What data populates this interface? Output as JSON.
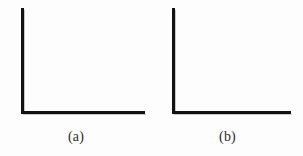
{
  "figure": {
    "background_color": "#fdfdfd",
    "stroke_color": "#121212",
    "shadow_color": "#c9c9c9",
    "caption_color": "#2b2b2b",
    "panels": [
      {
        "id": "a",
        "caption": "(a)",
        "shape": "L-shaped axis (vertical arm and horizontal arm)",
        "vertical_arm_length_px": 106,
        "horizontal_arm_length_px": 124,
        "stroke_width_px": 3
      },
      {
        "id": "b",
        "caption": "(b)",
        "shape": "L-shaped axis (vertical arm and horizontal arm)",
        "vertical_arm_length_px": 106,
        "horizontal_arm_length_px": 119,
        "stroke_width_px": 3
      }
    ]
  }
}
